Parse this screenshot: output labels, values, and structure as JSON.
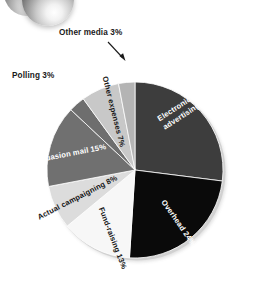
{
  "figure": {
    "title": "",
    "ornament_icon": "sphere-ornament"
  },
  "chart_data": {
    "type": "pie",
    "title": "",
    "subtitle": "",
    "xlabel": "",
    "ylabel": "",
    "grid": false,
    "legend_position": "none",
    "units": "percent",
    "center": {
      "x": 135,
      "y": 170
    },
    "radius": 88,
    "start_angle_deg": 0,
    "direction": "clockwise",
    "categories": [
      "Electronic media advertising",
      "Overhead",
      "Fund-raising",
      "Actual campaigning",
      "Persuasion mail",
      "Polling",
      "Other expenses",
      "Other media"
    ],
    "values": [
      27,
      24,
      13,
      8,
      15,
      3,
      7,
      3
    ],
    "colors": [
      "#3d3d3d",
      "#0a0a0a",
      "#f7f7f7",
      "#dcdcdc",
      "#707070",
      "#6e6e6e",
      "#c8c8c8",
      "#b4b4b4"
    ],
    "slices": [
      {
        "label": "Electronic media advertising",
        "value": 27,
        "display": "Electronic media advertising 27%",
        "color": "#3d3d3d",
        "label_color": "#ffffff",
        "label_placement": "inside"
      },
      {
        "label": "Overhead",
        "value": 24,
        "display": "Overhead 24%",
        "color": "#0a0a0a",
        "label_color": "#ffffff",
        "label_placement": "inside"
      },
      {
        "label": "Fund-raising",
        "value": 13,
        "display": "Fund-raising 13%",
        "color": "#f7f7f7",
        "label_color": "#161616",
        "label_placement": "inside"
      },
      {
        "label": "Actual campaigning",
        "value": 8,
        "display": "Actual campaigning 8%",
        "color": "#dcdcdc",
        "label_color": "#161616",
        "label_placement": "inside"
      },
      {
        "label": "Persuasion mail",
        "value": 15,
        "display": "Persuasion mail 15%",
        "color": "#707070",
        "label_color": "#ffffff",
        "label_placement": "inside"
      },
      {
        "label": "Polling",
        "value": 3,
        "display": "Polling 3%",
        "color": "#6e6e6e",
        "label_color": "#1a1a1a",
        "label_placement": "callout-left"
      },
      {
        "label": "Other expenses",
        "value": 7,
        "display": "Other expenses 7%",
        "color": "#c8c8c8",
        "label_color": "#161616",
        "label_placement": "inside"
      },
      {
        "label": "Other media",
        "value": 3,
        "display": "Other media 3%",
        "color": "#b4b4b4",
        "label_color": "#1a1a1a",
        "label_placement": "callout-top-arrow"
      }
    ],
    "total": 100
  },
  "labels": {
    "other_media": "Other media 3%",
    "polling": "Polling 3%",
    "other_expenses": "Other expenses 7%",
    "electronic_media": "Electronic media advertising 27%",
    "overhead": "Overhead 24%",
    "fund_raising": "Fund-raising 13%",
    "actual_campaigning": "Actual campaigning 8%",
    "persuasion_mail": "Persuasion mail 15%"
  }
}
